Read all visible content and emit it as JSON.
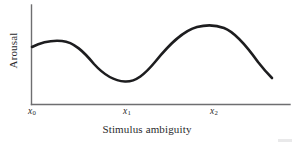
{
  "figure": {
    "y_axis_title": "Arousal",
    "x_axis_title": "Stimulus ambiguity",
    "curve_color": "#1d1d1f",
    "axis_color": "#6e6e70",
    "background_color": "#ffffff"
  },
  "ticks": [
    {
      "name": "x0",
      "base": "x",
      "sub": "0",
      "x_px": 33
    },
    {
      "name": "x1",
      "base": "x",
      "sub": "1",
      "x_px": 128
    },
    {
      "name": "x2",
      "base": "x",
      "sub": "2",
      "x_px": 215
    }
  ],
  "chart_data": {
    "type": "line",
    "title": "",
    "xlabel": "Stimulus ambiguity",
    "ylabel": "Arousal",
    "grid": false,
    "legend": null,
    "xticks": [
      "x0",
      "x1",
      "x2"
    ],
    "xtick_labels": [
      "x₀",
      "x₁",
      "x₂"
    ],
    "yticks": [],
    "xlim": [
      0,
      1
    ],
    "ylim": [
      0,
      1
    ],
    "series": [
      {
        "name": "Arousal response",
        "comment": "Normalized coordinates; x in [0,1] across plotted span, y in [0,1] with 1 = top of plot area",
        "x": [
          0.0,
          0.05,
          0.12,
          0.2,
          0.28,
          0.36,
          0.42,
          0.47,
          0.52,
          0.58,
          0.65,
          0.72,
          0.78,
          0.84,
          0.9,
          0.95,
          1.0
        ],
        "y": [
          0.58,
          0.62,
          0.65,
          0.64,
          0.58,
          0.45,
          0.32,
          0.24,
          0.23,
          0.33,
          0.52,
          0.7,
          0.81,
          0.85,
          0.81,
          0.68,
          0.48
        ]
      }
    ],
    "features": {
      "local_maximum_1": {
        "x_label": "between x0 and x1",
        "x_px": 62,
        "y_px": 41
      },
      "local_minimum": {
        "x_label": "x1",
        "x_px": 132,
        "y_px": 81
      },
      "local_maximum_2": {
        "x_label": "x2",
        "x_px": 219,
        "y_px": 26
      },
      "curve_start": {
        "x_px": 32,
        "y_px": 47
      },
      "curve_end": {
        "x_px": 272,
        "y_px": 78
      }
    }
  }
}
